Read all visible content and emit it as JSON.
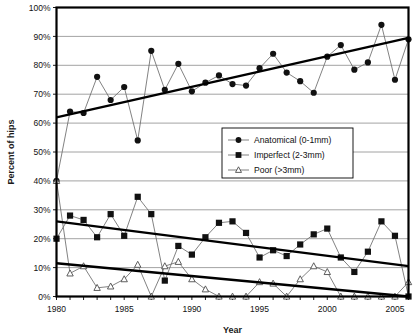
{
  "chart_data": {
    "type": "line",
    "title": "",
    "xlabel": "Year",
    "ylabel": "Percent of hips",
    "xlim": [
      1980,
      2006
    ],
    "ylim": [
      0,
      100
    ],
    "xticks": [
      1980,
      1985,
      1990,
      1995,
      2000,
      2005
    ],
    "xtick_labels": [
      "1980",
      "1985",
      "1990",
      "1995",
      "2000",
      "2005"
    ],
    "yticks": [
      0,
      10,
      20,
      30,
      40,
      50,
      60,
      70,
      80,
      90,
      100
    ],
    "ytick_labels": [
      "0%",
      "10%",
      "20%",
      "30%",
      "40%",
      "50%",
      "60%",
      "70%",
      "80%",
      "90%",
      "100%"
    ],
    "grid": "horizontal",
    "legend_position": "center-right",
    "x": [
      1980,
      1981,
      1982,
      1983,
      1984,
      1985,
      1986,
      1987,
      1988,
      1989,
      1990,
      1991,
      1992,
      1993,
      1994,
      1995,
      1996,
      1997,
      1998,
      1999,
      2000,
      2001,
      2002,
      2003,
      2004,
      2005,
      2006
    ],
    "series": [
      {
        "name": "Anatomical (0-1mm)",
        "marker": "filled-circle",
        "values": [
          40,
          64,
          63.5,
          76,
          68,
          72.5,
          54,
          85,
          71.5,
          80.5,
          71,
          74,
          76.5,
          73.5,
          73,
          79,
          84,
          77.5,
          74.5,
          70.5,
          83,
          87,
          78.5,
          81,
          94,
          75,
          89
        ],
        "trend": {
          "start_year": 1980,
          "start_value": 62,
          "end_year": 2006,
          "end_value": 89.5
        }
      },
      {
        "name": "Imperfect (2-3mm)",
        "marker": "filled-square",
        "values": [
          20,
          28,
          26.5,
          20.5,
          28.5,
          21,
          34.5,
          28.5,
          5.5,
          17.5,
          14.5,
          20.5,
          25.5,
          26,
          22,
          13.5,
          16,
          14,
          18,
          21.5,
          23.5,
          13.5,
          8.5,
          15.5,
          26,
          21,
          0
        ],
        "trend": {
          "start_year": 1980,
          "start_value": 26,
          "end_year": 2006,
          "end_value": 10.5
        }
      },
      {
        "name": "Poor (>3mm)",
        "marker": "open-triangle",
        "values": [
          40,
          8,
          10.5,
          3,
          3.5,
          6,
          11,
          0,
          10.5,
          12,
          6,
          2.5,
          0,
          0,
          0,
          5,
          4.5,
          0,
          6,
          10.5,
          8.5,
          0,
          0,
          0,
          0,
          0,
          5
        ],
        "trend": {
          "start_year": 1980,
          "start_value": 11.5,
          "end_year": 2006,
          "end_value": 0
        }
      }
    ]
  }
}
